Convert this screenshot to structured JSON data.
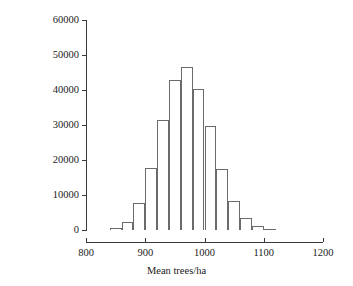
{
  "chart_data": {
    "type": "bar",
    "title": "",
    "subtitle": "",
    "xlabel": "Mean trees/ha",
    "ylabel": "Frequency",
    "xlim": [
      800,
      1200
    ],
    "ylim": [
      0,
      60000
    ],
    "xticks": [
      "800",
      "900",
      "1000",
      "1100",
      "1200"
    ],
    "xtick_values": [
      800,
      900,
      1000,
      1100,
      1200
    ],
    "yticks": [
      "0",
      "10000",
      "20000",
      "30000",
      "40000",
      "50000",
      "60000"
    ],
    "ytick_values": [
      0,
      10000,
      20000,
      30000,
      40000,
      50000,
      60000
    ],
    "grid": false,
    "legend": null,
    "bin_width": 20,
    "bin_edges": [
      840,
      860,
      880,
      900,
      920,
      940,
      960,
      980,
      1000,
      1020,
      1040,
      1060,
      1080,
      1100,
      1120
    ],
    "categories": [
      "840-860",
      "860-880",
      "880-900",
      "900-920",
      "920-940",
      "940-960",
      "960-980",
      "980-1000",
      "1000-1020",
      "1020-1040",
      "1040-1060",
      "1060-1080",
      "1080-1100",
      "1100-1120"
    ],
    "values": [
      600,
      2300,
      7800,
      17800,
      31500,
      43000,
      46700,
      40300,
      29700,
      17400,
      8400,
      3400,
      1100,
      300
    ],
    "bar_fill": "#ffffff",
    "bar_edge": "#6b6b6b",
    "axis_color": "#3a3a3a",
    "background": "#ffffff"
  }
}
